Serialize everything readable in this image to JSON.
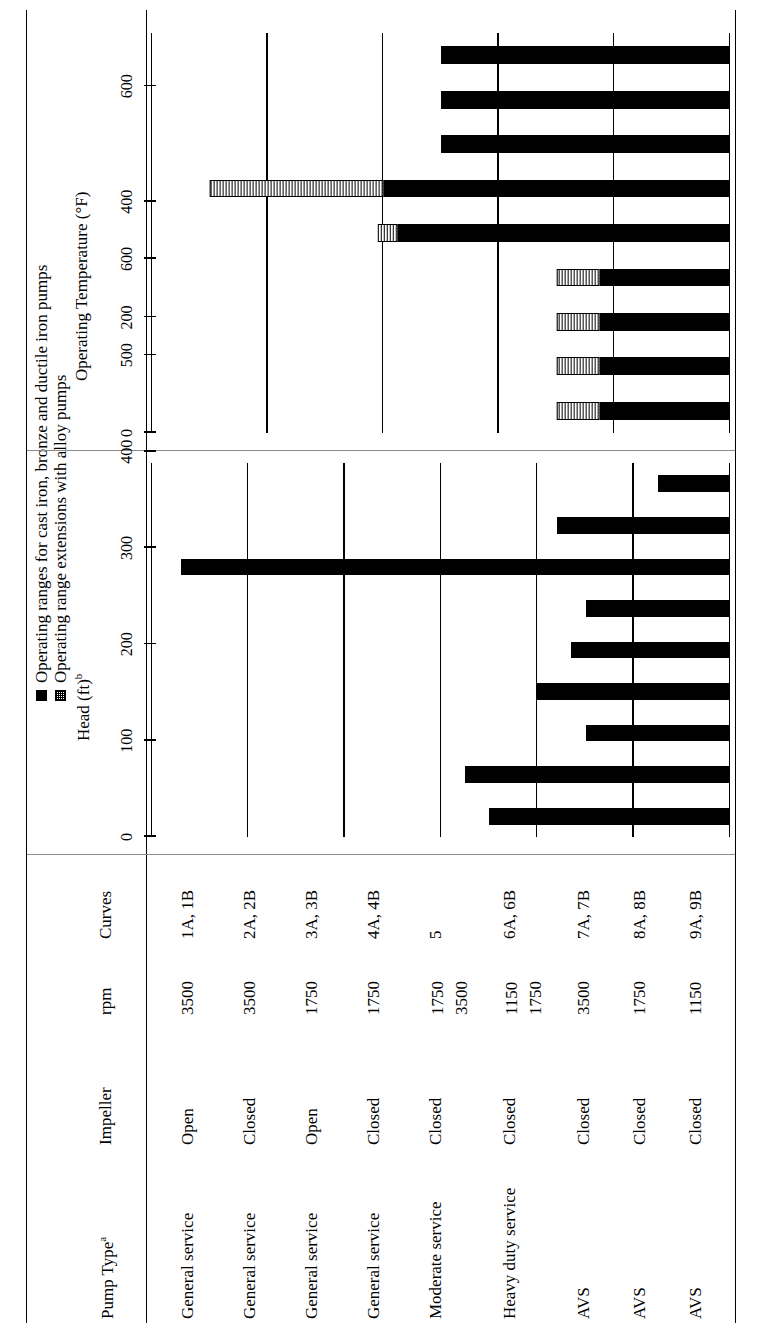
{
  "legend": {
    "items": [
      {
        "marker": "solid-square",
        "label": "Operating ranges for cast iron, bronze and ductile iron pumps"
      },
      {
        "marker": "hatched-square",
        "label": "Operating range extensions with alloy pumps"
      }
    ]
  },
  "table": {
    "headers": {
      "pump_type": "Pump Type",
      "pump_type_note": "a",
      "impeller": "Impeller",
      "rpm": "rpm",
      "curves": "Curves"
    },
    "rows": [
      {
        "pump_type": "General service",
        "impeller": "Open",
        "rpm": "3500",
        "curves": "1A, 1B"
      },
      {
        "pump_type": "General service",
        "impeller": "Closed",
        "rpm": "3500",
        "curves": "2A, 2B"
      },
      {
        "pump_type": "General service",
        "impeller": "Open",
        "rpm": "1750",
        "curves": "3A, 3B"
      },
      {
        "pump_type": "General service",
        "impeller": "Closed",
        "rpm": "1750",
        "curves": "4A, 4B"
      },
      {
        "pump_type": "Moderate service",
        "impeller": "Closed",
        "rpm": "1750\n3500",
        "curves": "5"
      },
      {
        "pump_type": "Heavy duty service",
        "impeller": "Closed",
        "rpm": "1150\n1750",
        "curves": "6A, 6B"
      },
      {
        "pump_type": "AVS",
        "impeller": "Closed",
        "rpm": "3500",
        "curves": "7A, 7B"
      },
      {
        "pump_type": "AVS",
        "impeller": "Closed",
        "rpm": "1750",
        "curves": "8A, 8B"
      },
      {
        "pump_type": "AVS",
        "impeller": "Closed",
        "rpm": "1150",
        "curves": "9A, 9B"
      }
    ]
  },
  "chart_data": [
    {
      "type": "bar",
      "id": "head",
      "title": "Head (ft)",
      "title_note": "b",
      "xlabel": "",
      "ylabel": "Head (ft)",
      "orientation": "horizontal",
      "grid": true,
      "axis_range": [
        0,
        600
      ],
      "ticks": [
        0,
        100,
        200,
        300,
        400,
        500,
        600
      ],
      "tick_labels": [
        "0",
        "100",
        "200",
        "300",
        "400",
        "500",
        "600"
      ],
      "categories": [
        "1A, 1B",
        "2A, 2B",
        "3A, 3B",
        "4A, 4B",
        "5",
        "6A, 6B",
        "7A, 7B",
        "8A, 8B",
        "9A, 9B"
      ],
      "series": [
        {
          "name": "Operating ranges for cast iron, bronze and ductile iron pumps",
          "style": "solid",
          "values": [
            250,
            275,
            150,
            200,
            165,
            150,
            570,
            180,
            75
          ]
        }
      ]
    },
    {
      "type": "bar",
      "id": "temperature",
      "title": "Operating Temperature (°F)",
      "xlabel": "",
      "ylabel": "Operating Temperature (°F)",
      "orientation": "horizontal",
      "grid": true,
      "axis_range": [
        0,
        1000
      ],
      "ticks": [
        0,
        200,
        400,
        600,
        800,
        1000
      ],
      "tick_labels": [
        "0",
        "200",
        "400",
        "600",
        "800",
        "1000"
      ],
      "categories": [
        "1A, 1B",
        "2A, 2B",
        "3A, 3B",
        "4A, 4B",
        "5",
        "6A, 6B",
        "7A, 7B",
        "8A, 8B",
        "9A, 9B"
      ],
      "series": [
        {
          "name": "Operating ranges for cast iron, bronze and ductile iron pumps",
          "style": "solid",
          "values": [
            225,
            225,
            225,
            225,
            575,
            600,
            500,
            500,
            500
          ]
        },
        {
          "name": "Operating range extensions with alloy pumps",
          "style": "hatched",
          "values": [
            300,
            300,
            300,
            300,
            610,
            900,
            500,
            500,
            500
          ]
        }
      ]
    }
  ]
}
